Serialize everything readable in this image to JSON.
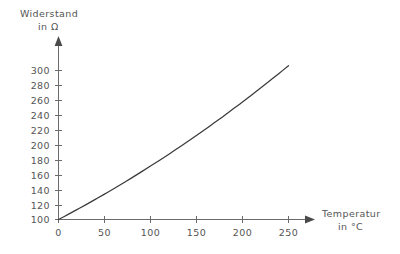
{
  "chart_data": {
    "type": "line",
    "title": "",
    "subtitle": "",
    "ylabel_line1": "Widerstand",
    "ylabel_line2": "in  Ω",
    "xlabel_line1": "Temperatur",
    "xlabel_line2": "in  °C",
    "xlabel": "Temperatur in °C",
    "ylabel": "Widerstand in Ω",
    "xlim": [
      0,
      265
    ],
    "ylim": [
      100,
      310
    ],
    "xticks": [
      0,
      50,
      100,
      150,
      200,
      250
    ],
    "xtick_labels": [
      "0",
      "50",
      "100",
      "150",
      "200",
      "250"
    ],
    "yticks": [
      100,
      120,
      140,
      160,
      180,
      200,
      220,
      240,
      260,
      280,
      300
    ],
    "ytick_labels": [
      "100",
      "120",
      "140",
      "160",
      "180",
      "200",
      "220",
      "240",
      "260",
      "280",
      "300"
    ],
    "grid": false,
    "legend": false,
    "legend_position": "none",
    "axis_arrows": true,
    "series": [
      {
        "name": "Widerstandskennlinie",
        "color": "#3a3a3a",
        "x": [
          0,
          10,
          20,
          30,
          40,
          50,
          60,
          70,
          80,
          90,
          100,
          110,
          120,
          130,
          140,
          150,
          160,
          170,
          180,
          190,
          200,
          210,
          220,
          230,
          240,
          250
        ],
        "y": [
          100,
          106.5,
          113.2,
          120.0,
          127.0,
          134.1,
          141.3,
          148.7,
          156.2,
          163.9,
          171.7,
          179.6,
          187.7,
          196.0,
          204.3,
          212.9,
          221.5,
          230.4,
          239.3,
          248.5,
          257.7,
          267.2,
          276.7,
          286.5,
          296.4,
          306.5
        ]
      }
    ],
    "annotations": []
  },
  "colors": {
    "background": "#ffffff",
    "axis": "#6b6b6b",
    "curve": "#3a3a3a",
    "text": "#555555"
  }
}
